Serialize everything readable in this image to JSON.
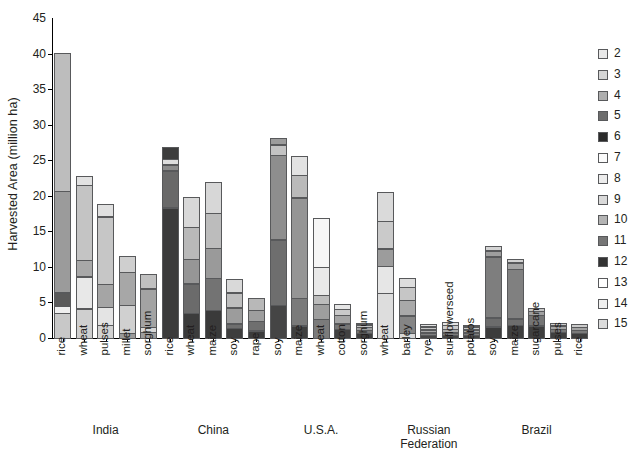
{
  "chart_data": {
    "type": "bar",
    "stacked": true,
    "title": "",
    "xlabel": "",
    "ylabel": "Harvested Area (million ha)",
    "ylim": [
      0,
      45
    ],
    "yticks": [
      0,
      5,
      10,
      15,
      20,
      25,
      30,
      35,
      40,
      45
    ],
    "grid": false,
    "legend_position": "right",
    "legend_title": "",
    "legend_entries": [
      {
        "label": "2",
        "color": "#e8e8e8"
      },
      {
        "label": "3",
        "color": "#d5d5d5"
      },
      {
        "label": "4",
        "color": "#aeaeae"
      },
      {
        "label": "5",
        "color": "#6d6d6d"
      },
      {
        "label": "6",
        "color": "#2b2b2b"
      },
      {
        "label": "7",
        "color": "#fbfbfb"
      },
      {
        "label": "8",
        "color": "#ececec"
      },
      {
        "label": "9",
        "color": "#d9d9d9"
      },
      {
        "label": "10",
        "color": "#b4b4b4"
      },
      {
        "label": "11",
        "color": "#767676"
      },
      {
        "label": "12",
        "color": "#333333"
      },
      {
        "label": "13",
        "color": "#ffffff"
      },
      {
        "label": "14",
        "color": "#efefef"
      },
      {
        "label": "15",
        "color": "#dcdcdc"
      }
    ],
    "groups": [
      {
        "name": "India",
        "crops": [
          "rice",
          "wheat",
          "pulses",
          "millet",
          "sorghum"
        ]
      },
      {
        "name": "China",
        "crops": [
          "rice",
          "wheat",
          "maize",
          "soy",
          "rape"
        ]
      },
      {
        "name": "U.S.A.",
        "crops": [
          "soy",
          "maize",
          "wheat",
          "cotton",
          "sorghum"
        ]
      },
      {
        "name": "Russian\nFederation",
        "crops": [
          "wheat",
          "barley",
          "rye",
          "sunflowerseed",
          "potatos"
        ]
      },
      {
        "name": "Brazil",
        "crops": [
          "soy",
          "maize",
          "sugarcane",
          "pulses",
          "rice"
        ]
      }
    ],
    "categories": [
      "rice",
      "wheat",
      "pulses",
      "millet",
      "sorghum",
      "rice",
      "wheat",
      "maize",
      "soy",
      "rape",
      "soy",
      "maize",
      "wheat",
      "cotton",
      "sorghum",
      "wheat",
      "barley",
      "rye",
      "sunflowerseed",
      "potatos",
      "soy",
      "maize",
      "sugarcane",
      "pulses",
      "rice"
    ],
    "totals": [
      40.5,
      23.2,
      19.2,
      11.8,
      9.3,
      27.3,
      20.3,
      22.3,
      8.7,
      6.0,
      28.5,
      26.0,
      17.3,
      5.2,
      2.6,
      20.9,
      8.9,
      2.4,
      2.7,
      2.3,
      13.3,
      11.6,
      4.5,
      2.5,
      2.3
    ],
    "bars": [
      {
        "country": "India",
        "crop": "rice",
        "total": 40.5,
        "segments": [
          {
            "class": "3",
            "value": 3.6,
            "color": "#c8c8c8"
          },
          {
            "class": "14",
            "value": 1.0,
            "color": "#efefef"
          },
          {
            "class": "6",
            "value": 2.0,
            "color": "#5a5a5a"
          },
          {
            "class": "4",
            "value": 14.4,
            "color": "#9b9b9b"
          },
          {
            "class": "3",
            "value": 19.5,
            "color": "#bdbdbd"
          }
        ]
      },
      {
        "country": "India",
        "crop": "wheat",
        "total": 23.2,
        "segments": [
          {
            "class": "2",
            "value": 4.2,
            "color": "#cfcfcf"
          },
          {
            "class": "7",
            "value": 4.6,
            "color": "#e8e8e8"
          },
          {
            "class": "4",
            "value": 2.4,
            "color": "#a8a8a8"
          },
          {
            "class": "3",
            "value": 10.6,
            "color": "#c4c4c4"
          },
          {
            "class": "14",
            "value": 1.4,
            "color": "#e2e2e2"
          }
        ]
      },
      {
        "country": "India",
        "crop": "pulses",
        "total": 19.2,
        "segments": [
          {
            "class": "2",
            "value": 1.9,
            "color": "#d2d2d2"
          },
          {
            "class": "8",
            "value": 2.6,
            "color": "#e4e4e4"
          },
          {
            "class": "4",
            "value": 3.3,
            "color": "#a5a5a5"
          },
          {
            "class": "3",
            "value": 9.6,
            "color": "#c6c6c6"
          },
          {
            "class": "14",
            "value": 1.8,
            "color": "#e0e0e0"
          }
        ]
      },
      {
        "country": "India",
        "crop": "millet",
        "total": 11.8,
        "segments": [
          {
            "class": "5",
            "value": 0.8,
            "color": "#9a9a9a"
          },
          {
            "class": "2",
            "value": 4.0,
            "color": "#d0d0d0"
          },
          {
            "class": "4",
            "value": 4.7,
            "color": "#a7a7a7"
          },
          {
            "class": "3",
            "value": 2.3,
            "color": "#cfcfcf"
          }
        ]
      },
      {
        "country": "India",
        "crop": "sorghum",
        "total": 9.3,
        "segments": [
          {
            "class": "5",
            "value": 0.9,
            "color": "#9c9c9c"
          },
          {
            "class": "2",
            "value": 0.8,
            "color": "#d6d6d6"
          },
          {
            "class": "4",
            "value": 5.5,
            "color": "#a3a3a3"
          },
          {
            "class": "3",
            "value": 2.1,
            "color": "#c0c0c0"
          }
        ]
      },
      {
        "country": "China",
        "crop": "rice",
        "total": 27.3,
        "segments": [
          {
            "class": "12",
            "value": 18.4,
            "color": "#3b3b3b"
          },
          {
            "class": "11",
            "value": 5.3,
            "color": "#696969"
          },
          {
            "class": "5",
            "value": 0.9,
            "color": "#8d8d8d"
          },
          {
            "class": "14",
            "value": 0.9,
            "color": "#dedede"
          },
          {
            "class": "12",
            "value": 1.8,
            "color": "#3d3d3d"
          }
        ]
      },
      {
        "country": "China",
        "crop": "wheat",
        "total": 20.3,
        "segments": [
          {
            "class": "12",
            "value": 3.6,
            "color": "#3c3c3c"
          },
          {
            "class": "11",
            "value": 4.2,
            "color": "#6b6b6b"
          },
          {
            "class": "10",
            "value": 3.5,
            "color": "#969696"
          },
          {
            "class": "9",
            "value": 4.6,
            "color": "#b9b9b9"
          },
          {
            "class": "8",
            "value": 4.4,
            "color": "#d8d8d8"
          }
        ]
      },
      {
        "country": "China",
        "crop": "maize",
        "total": 22.3,
        "segments": [
          {
            "class": "12",
            "value": 4.0,
            "color": "#3a3a3a"
          },
          {
            "class": "11",
            "value": 4.6,
            "color": "#737373"
          },
          {
            "class": "10",
            "value": 4.3,
            "color": "#9a9a9a"
          },
          {
            "class": "9",
            "value": 5.0,
            "color": "#bcbcbc"
          },
          {
            "class": "8",
            "value": 4.4,
            "color": "#d7d7d7"
          }
        ]
      },
      {
        "country": "China",
        "crop": "soy",
        "total": 8.7,
        "segments": [
          {
            "class": "12",
            "value": 1.5,
            "color": "#3d3d3d"
          },
          {
            "class": "11",
            "value": 0.7,
            "color": "#6e6e6e"
          },
          {
            "class": "10",
            "value": 2.3,
            "color": "#9c9c9c"
          },
          {
            "class": "9",
            "value": 2.2,
            "color": "#bebebe"
          },
          {
            "class": "8",
            "value": 2.0,
            "color": "#d9d9d9"
          }
        ]
      },
      {
        "country": "China",
        "crop": "rape",
        "total": 6.0,
        "segments": [
          {
            "class": "12",
            "value": 1.1,
            "color": "#3c3c3c"
          },
          {
            "class": "11",
            "value": 1.4,
            "color": "#6f6f6f"
          },
          {
            "class": "10",
            "value": 1.7,
            "color": "#9e9e9e"
          },
          {
            "class": "9",
            "value": 1.8,
            "color": "#b8b8b8"
          }
        ]
      },
      {
        "country": "U.S.A.",
        "crop": "soy",
        "total": 28.5,
        "segments": [
          {
            "class": "12",
            "value": 4.7,
            "color": "#454545"
          },
          {
            "class": "11",
            "value": 9.3,
            "color": "#6e6e6e"
          },
          {
            "class": "10",
            "value": 12.0,
            "color": "#8e8e8e"
          },
          {
            "class": "9",
            "value": 1.5,
            "color": "#c3c3c3"
          },
          {
            "class": "10",
            "value": 1.0,
            "color": "#9c9c9c"
          }
        ]
      },
      {
        "country": "U.S.A.",
        "crop": "maize",
        "total": 26.0,
        "segments": [
          {
            "class": "12",
            "value": 1.8,
            "color": "#3f3f3f"
          },
          {
            "class": "11",
            "value": 4.0,
            "color": "#7a7a7a"
          },
          {
            "class": "10",
            "value": 14.2,
            "color": "#959595"
          },
          {
            "class": "9",
            "value": 3.2,
            "color": "#bababa"
          },
          {
            "class": "8",
            "value": 2.8,
            "color": "#e2e2e2"
          }
        ]
      },
      {
        "country": "U.S.A.",
        "crop": "wheat",
        "total": 17.3,
        "segments": [
          {
            "class": "11",
            "value": 2.7,
            "color": "#7b7b7b"
          },
          {
            "class": "10",
            "value": 2.2,
            "color": "#9e9e9e"
          },
          {
            "class": "9",
            "value": 1.4,
            "color": "#bcbcbc"
          },
          {
            "class": "14",
            "value": 4.0,
            "color": "#e9e9e9"
          },
          {
            "class": "13",
            "value": 7.0,
            "color": "#f6f6f6"
          }
        ]
      },
      {
        "country": "U.S.A.",
        "crop": "cotton",
        "total": 5.2,
        "segments": [
          {
            "class": "12",
            "value": 1.3,
            "color": "#414141"
          },
          {
            "class": "11",
            "value": 0.9,
            "color": "#767676"
          },
          {
            "class": "10",
            "value": 1.3,
            "color": "#a4a4a4"
          },
          {
            "class": "9",
            "value": 0.9,
            "color": "#c9c9c9"
          },
          {
            "class": "8",
            "value": 0.8,
            "color": "#e5e5e5"
          }
        ]
      },
      {
        "country": "U.S.A.",
        "crop": "sorghum",
        "total": 2.6,
        "segments": [
          {
            "class": "12",
            "value": 0.8,
            "color": "#3e3e3e"
          },
          {
            "class": "11",
            "value": 0.5,
            "color": "#747474"
          },
          {
            "class": "10",
            "value": 0.5,
            "color": "#a0a0a0"
          },
          {
            "class": "9",
            "value": 0.4,
            "color": "#c4c4c4"
          },
          {
            "class": "8",
            "value": 0.4,
            "color": "#e3e3e3"
          }
        ]
      },
      {
        "country": "Russian Federation",
        "crop": "wheat",
        "total": 20.9,
        "segments": [
          {
            "class": "14",
            "value": 6.4,
            "color": "#dddddd"
          },
          {
            "class": "13",
            "value": 3.9,
            "color": "#e6e6e6"
          },
          {
            "class": "10",
            "value": 2.5,
            "color": "#9c9c9c"
          },
          {
            "class": "9",
            "value": 4.0,
            "color": "#cacaca"
          },
          {
            "class": "8",
            "value": 4.1,
            "color": "#dadada"
          }
        ]
      },
      {
        "country": "Russian Federation",
        "crop": "barley",
        "total": 8.9,
        "segments": [
          {
            "class": "14",
            "value": 0.8,
            "color": "#d9d9d9"
          },
          {
            "class": "11",
            "value": 2.5,
            "color": "#858585"
          },
          {
            "class": "10",
            "value": 2.3,
            "color": "#a9a9a9"
          },
          {
            "class": "9",
            "value": 1.9,
            "color": "#c6c6c6"
          },
          {
            "class": "8",
            "value": 1.4,
            "color": "#dddddd"
          }
        ]
      },
      {
        "country": "Russian Federation",
        "crop": "rye",
        "total": 2.4,
        "segments": [
          {
            "class": "12",
            "value": 0.5,
            "color": "#474747"
          },
          {
            "class": "11",
            "value": 0.4,
            "color": "#7e7e7e"
          },
          {
            "class": "10",
            "value": 0.5,
            "color": "#a6a6a6"
          },
          {
            "class": "9",
            "value": 0.5,
            "color": "#c6c6c6"
          },
          {
            "class": "8",
            "value": 0.5,
            "color": "#e1e1e1"
          }
        ]
      },
      {
        "country": "Russian Federation",
        "crop": "sunflowerseed",
        "total": 2.7,
        "segments": [
          {
            "class": "12",
            "value": 0.5,
            "color": "#444444"
          },
          {
            "class": "11",
            "value": 0.4,
            "color": "#7b7b7b"
          },
          {
            "class": "10",
            "value": 0.6,
            "color": "#a8a8a8"
          },
          {
            "class": "9",
            "value": 0.6,
            "color": "#cccccc"
          },
          {
            "class": "8",
            "value": 0.6,
            "color": "#e4e4e4"
          }
        ]
      },
      {
        "country": "Russian Federation",
        "crop": "potatos",
        "total": 2.3,
        "segments": [
          {
            "class": "12",
            "value": 0.5,
            "color": "#454545"
          },
          {
            "class": "11",
            "value": 0.4,
            "color": "#7d7d7d"
          },
          {
            "class": "10",
            "value": 0.5,
            "color": "#a5a5a5"
          },
          {
            "class": "9",
            "value": 0.5,
            "color": "#c8c8c8"
          },
          {
            "class": "8",
            "value": 0.4,
            "color": "#e2e2e2"
          }
        ]
      },
      {
        "country": "Brazil",
        "crop": "soy",
        "total": 13.3,
        "segments": [
          {
            "class": "12",
            "value": 1.7,
            "color": "#3c3c3c"
          },
          {
            "class": "11",
            "value": 1.3,
            "color": "#6c6c6c"
          },
          {
            "class": "5",
            "value": 8.7,
            "color": "#7e7e7e"
          },
          {
            "class": "10",
            "value": 0.9,
            "color": "#9e9e9e"
          },
          {
            "class": "14",
            "value": 0.7,
            "color": "#d4d4d4"
          }
        ]
      },
      {
        "country": "Brazil",
        "crop": "maize",
        "total": 11.6,
        "segments": [
          {
            "class": "12",
            "value": 1.9,
            "color": "#3e3e3e"
          },
          {
            "class": "11",
            "value": 1.0,
            "color": "#6d6d6d"
          },
          {
            "class": "5",
            "value": 7.0,
            "color": "#808080"
          },
          {
            "class": "10",
            "value": 1.0,
            "color": "#a4a4a4"
          },
          {
            "class": "14",
            "value": 0.7,
            "color": "#d2d2d2"
          }
        ]
      },
      {
        "country": "Brazil",
        "crop": "sugarcane",
        "total": 4.5,
        "segments": [
          {
            "class": "12",
            "value": 1.8,
            "color": "#3f3f3f"
          },
          {
            "class": "11",
            "value": 1.6,
            "color": "#757575"
          },
          {
            "class": "10",
            "value": 0.6,
            "color": "#a0a0a0"
          },
          {
            "class": "9",
            "value": 0.5,
            "color": "#c5c5c5"
          }
        ]
      },
      {
        "country": "Brazil",
        "crop": "pulses",
        "total": 2.5,
        "segments": [
          {
            "class": "12",
            "value": 0.9,
            "color": "#3f3f3f"
          },
          {
            "class": "11",
            "value": 0.5,
            "color": "#787878"
          },
          {
            "class": "10",
            "value": 0.6,
            "color": "#a6a6a6"
          },
          {
            "class": "9",
            "value": 0.5,
            "color": "#cfcfcf"
          }
        ]
      },
      {
        "country": "Brazil",
        "crop": "rice",
        "total": 2.3,
        "segments": [
          {
            "class": "12",
            "value": 0.8,
            "color": "#3d3d3d"
          },
          {
            "class": "11",
            "value": 0.5,
            "color": "#7a7a7a"
          },
          {
            "class": "10",
            "value": 0.5,
            "color": "#a3a3a3"
          },
          {
            "class": "9",
            "value": 0.5,
            "color": "#cbcbcb"
          }
        ]
      }
    ]
  }
}
